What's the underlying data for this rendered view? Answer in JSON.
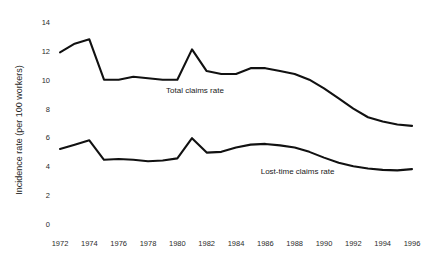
{
  "chart_data": {
    "type": "line",
    "title": "",
    "xlabel": "",
    "ylabel": "Incidence rate (per 100 workers)",
    "xlim": [
      1972,
      1996
    ],
    "ylim": [
      0,
      14
    ],
    "grid": false,
    "legend_position": "inline-labels",
    "x_ticks": [
      "1972",
      "1974",
      "1976",
      "1978",
      "1980",
      "1982",
      "1984",
      "1986",
      "1988",
      "1990",
      "1992",
      "1994",
      "1996"
    ],
    "x_tick_values": [
      1972,
      1974,
      1976,
      1978,
      1980,
      1982,
      1984,
      1986,
      1988,
      1990,
      1992,
      1994,
      1996
    ],
    "y_ticks": [
      "0",
      "2",
      "4",
      "6",
      "8",
      "10",
      "12",
      "14"
    ],
    "y_tick_values": [
      0,
      2,
      4,
      6,
      8,
      10,
      12,
      14
    ],
    "x": [
      1972,
      1973,
      1974,
      1975,
      1976,
      1977,
      1978,
      1979,
      1980,
      1981,
      1982,
      1983,
      1984,
      1985,
      1986,
      1987,
      1988,
      1989,
      1990,
      1991,
      1992,
      1993,
      1994,
      1995,
      1996
    ],
    "series": [
      {
        "name": "Total claims rate",
        "color": "#111111",
        "label_x": 1981.2,
        "label_y": 9.1,
        "values": [
          11.9,
          12.5,
          12.8,
          10.0,
          10.0,
          10.2,
          10.1,
          10.0,
          10.0,
          12.1,
          10.6,
          10.4,
          10.4,
          10.8,
          10.8,
          10.6,
          10.4,
          10.0,
          9.4,
          8.7,
          8.0,
          7.4,
          7.1,
          6.9,
          6.8
        ]
      },
      {
        "name": "Lost-time claims rate",
        "color": "#111111",
        "label_x": 1988.2,
        "label_y": 3.45,
        "values": [
          5.2,
          5.5,
          5.8,
          4.45,
          4.5,
          4.45,
          4.35,
          4.4,
          4.55,
          5.95,
          4.95,
          5.0,
          5.3,
          5.5,
          5.55,
          5.45,
          5.3,
          5.0,
          4.6,
          4.25,
          4.0,
          3.85,
          3.75,
          3.72,
          3.8
        ]
      }
    ]
  }
}
